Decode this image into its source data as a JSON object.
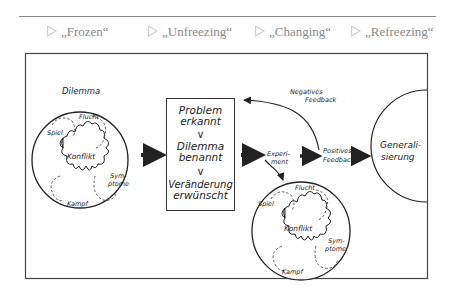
{
  "header": {
    "phases": [
      {
        "label": "„Frozen“"
      },
      {
        "label": "„Unfreezing“"
      },
      {
        "label": "„Changing“"
      },
      {
        "label": "„Refreezing“"
      }
    ]
  },
  "diagram": {
    "dilemma_label": "Dilemma",
    "circle_left": {
      "center": "Konflikt",
      "flucht": "Flucht",
      "spiel": "Spiel",
      "kampf": "Kampf",
      "symptome_1": "Sym-",
      "symptome_2": "ptome"
    },
    "box": {
      "step1_line1": "Problem",
      "step1_line2": "erkannt",
      "step2_line1": "Dilemma",
      "step2_line2": "benannt",
      "step3_line1": "Veränderung",
      "step3_line2": "erwünscht",
      "chevron": "∨"
    },
    "experiment_1": "Experi-",
    "experiment_2": "ment",
    "negative_feedback_1": "Negatives",
    "negative_feedback_2": "Feedback",
    "positive_feedback_1": "Positives",
    "positive_feedback_2": "Feedback",
    "generalisierung_1": "Generali-",
    "generalisierung_2": "sierung",
    "circle_right": {
      "center": "Konflikt",
      "flucht": "Flucht",
      "spiel": "Spiel",
      "kampf": "Kampf",
      "symptome_1": "Sym-",
      "symptome_2": "ptome"
    }
  },
  "colors": {
    "line": "#333333",
    "phase_text": "#888888",
    "phase_triangle": "#cccccc"
  }
}
